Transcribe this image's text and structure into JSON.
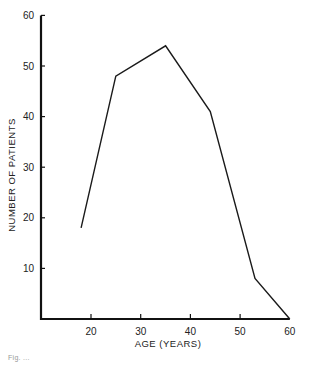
{
  "chart_data": {
    "type": "line",
    "title": "",
    "xlabel": "AGE  (YEARS)",
    "ylabel": "NUMBER OF PATIENTS",
    "x_ticks": [
      20,
      30,
      40,
      50,
      60
    ],
    "y_ticks": [
      10,
      20,
      30,
      40,
      50,
      60
    ],
    "xlim": [
      10,
      60
    ],
    "ylim": [
      0,
      60
    ],
    "grid": false,
    "legend": null,
    "series": [
      {
        "name": "Patients",
        "x": [
          18,
          25,
          35,
          44,
          53,
          60
        ],
        "values": [
          18,
          48,
          54,
          41,
          8,
          0
        ]
      }
    ],
    "caption": "Fig. ..."
  },
  "labels": {
    "x_title": "AGE  (YEARS)",
    "y_title": "NUMBER OF PATIENTS",
    "caption": "Fig. ..."
  }
}
